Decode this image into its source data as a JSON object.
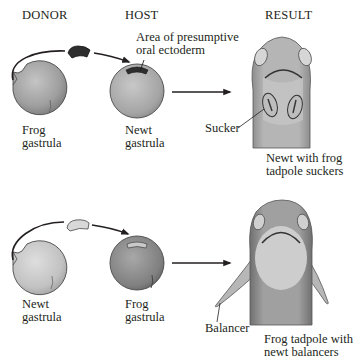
{
  "headers": {
    "donor": "DONOR",
    "host": "HOST",
    "result": "RESULT"
  },
  "top_row": {
    "donor_label_1": "Frog",
    "donor_label_2": "gastrula",
    "host_label_1": "Newt",
    "host_label_2": "gastrula",
    "callout_1": "Area of presumptive",
    "callout_2": "oral ectoderm",
    "result_part_label": "Sucker",
    "result_caption_1": "Newt with frog",
    "result_caption_2": "tadpole suckers"
  },
  "bottom_row": {
    "donor_label_1": "Newt",
    "donor_label_2": "gastrula",
    "host_label_1": "Frog",
    "host_label_2": "gastrula",
    "result_part_label": "Balancer",
    "result_caption_1": "Frog tadpole with",
    "result_caption_2": "newt balancers"
  },
  "colors": {
    "frog_tissue": "#a9a9a9",
    "newt_tissue": "#cfcfcf",
    "graft_dark": "#333333",
    "graft_light": "#d8d8d8",
    "ink": "#231f20"
  }
}
